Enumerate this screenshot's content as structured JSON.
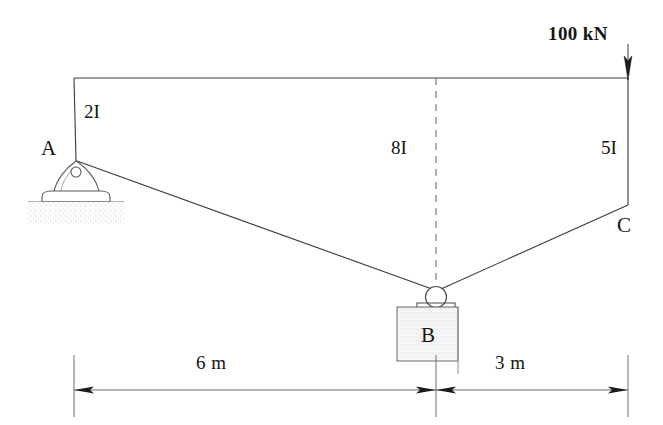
{
  "figure": {
    "type": "structural-frame-diagram",
    "ink_color": "#2a2a2a",
    "text_color": "#151515",
    "background": "#ffffff"
  },
  "load": {
    "label": "100 kN",
    "direction": "down",
    "applied_at": "top of column C"
  },
  "members": [
    {
      "name": "column-A",
      "stiffness_label": "2I"
    },
    {
      "name": "column-B",
      "stiffness_label": "8I"
    },
    {
      "name": "column-C",
      "stiffness_label": "5I"
    }
  ],
  "stiffness": {
    "left": "2I",
    "middle": "8I",
    "right": "5I"
  },
  "joints": {
    "a": {
      "label": "A",
      "support": "pin"
    },
    "b": {
      "label": "B",
      "support": "roller"
    },
    "c": {
      "label": "C",
      "support": "free"
    }
  },
  "dimensions": [
    {
      "name": "span-ab",
      "label": "6 m"
    },
    {
      "name": "span-bc",
      "label": "3 m"
    }
  ],
  "geometry": {
    "top_left": [
      74,
      78
    ],
    "top_right": [
      628,
      78
    ],
    "a": [
      76,
      160
    ],
    "b": [
      436,
      290
    ],
    "c": [
      628,
      205
    ],
    "dim_line_y": 390
  }
}
